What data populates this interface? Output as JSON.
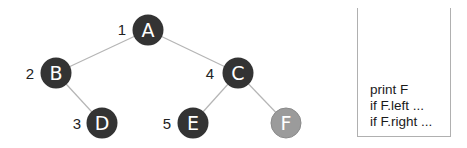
{
  "tree": {
    "nodes": [
      {
        "id": "A",
        "label": "A",
        "order": "1",
        "x": 148,
        "y": 30,
        "visited": true
      },
      {
        "id": "B",
        "label": "B",
        "order": "2",
        "x": 56,
        "y": 73,
        "visited": true
      },
      {
        "id": "C",
        "label": "C",
        "order": "4",
        "x": 238,
        "y": 73,
        "visited": true
      },
      {
        "id": "D",
        "label": "D",
        "order": "3",
        "x": 102,
        "y": 123,
        "visited": true
      },
      {
        "id": "E",
        "label": "E",
        "order": "5",
        "x": 193,
        "y": 123,
        "visited": true
      },
      {
        "id": "F",
        "label": "F",
        "order": "",
        "x": 286,
        "y": 123,
        "visited": false
      }
    ],
    "edges": [
      [
        "A",
        "B"
      ],
      [
        "A",
        "C"
      ],
      [
        "B",
        "D"
      ],
      [
        "C",
        "E"
      ],
      [
        "C",
        "F"
      ]
    ],
    "colors": {
      "visited": "#333333",
      "current": "#9b9b9b",
      "current_stroke": "#8a8a8a",
      "edge": "#b5b5b5"
    }
  },
  "code_box": {
    "lines": [
      "print F",
      "if F.left ...",
      "if F.right ..."
    ]
  }
}
